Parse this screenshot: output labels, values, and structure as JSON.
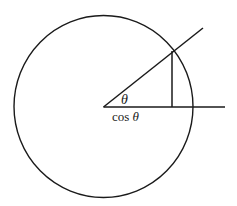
{
  "figure": {
    "background_color": "#ffffff",
    "stroke_color": "#1a1a1a",
    "width": 237,
    "height": 206
  },
  "labels": {
    "angle": "θ",
    "cosine_function": "cos",
    "cosine_variable": "θ",
    "cosine_full": "cos θ"
  },
  "geometry": {
    "circle": {
      "center_x": 103.5,
      "center_y": 106.5,
      "radius_x": 89.5,
      "radius_y": 91.0,
      "stroke_width": 1.4
    },
    "center_point": {
      "x": 103.5,
      "y": 106.5
    },
    "horizontal_axis": {
      "x1": 103.5,
      "y1": 107,
      "x2": 225,
      "y2": 107
    },
    "terminal_ray": {
      "x1": 103.5,
      "y1": 107,
      "x2": 203,
      "y2": 28
    },
    "circle_intersection": {
      "x": 172,
      "y": 51
    },
    "vertical_drop": {
      "x1": 172,
      "y1": 51,
      "x2": 172,
      "y2": 107
    },
    "angle_degrees": 38
  },
  "chart_data": {
    "type": "line",
    "xlabel": "",
    "ylabel": "",
    "annotations": [
      "θ",
      "cos θ"
    ],
    "series": [
      {
        "name": "unit-circle",
        "shape": "ellipse",
        "center": [
          103.5,
          106.5
        ],
        "radii": [
          89.5,
          91.0
        ]
      },
      {
        "name": "horizontal-axis",
        "points": [
          [
            103.5,
            107
          ],
          [
            225,
            107
          ]
        ]
      },
      {
        "name": "terminal-ray",
        "points": [
          [
            103.5,
            107
          ],
          [
            203,
            28
          ]
        ]
      },
      {
        "name": "sine-segment",
        "points": [
          [
            172,
            51
          ],
          [
            172,
            107
          ]
        ]
      }
    ]
  }
}
